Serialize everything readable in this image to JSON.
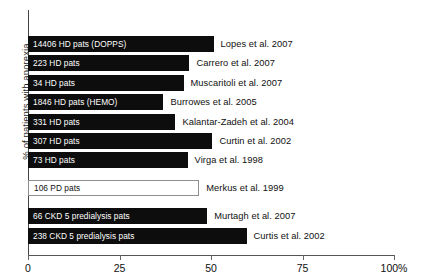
{
  "chart_data": {
    "type": "bar",
    "orientation": "horizontal",
    "title": "",
    "xlabel": "",
    "ylabel": "% of patients with anorexia",
    "xlim": [
      0,
      100
    ],
    "grid": false,
    "legend": "none",
    "xticks": [
      {
        "value": 0,
        "label": "0"
      },
      {
        "value": 25,
        "label": "25"
      },
      {
        "value": 50,
        "label": "50"
      },
      {
        "value": 75,
        "label": "75"
      },
      {
        "value": 100,
        "label": "100%"
      }
    ],
    "colors": {
      "filled_bar": "#0d0d0d",
      "open_bar_fill": "#ffffff",
      "open_bar_border": "#8e8e8e",
      "axis": "#555555",
      "text": "#101010",
      "inverse_text": "#ffffff"
    },
    "categories": [
      "Lopes et al. 2007",
      "Carrero et al. 2007",
      "Muscaritoli et al. 2007",
      "Burrowes et al. 2005",
      "Kalantar-Zadeh et al. 2004",
      "Curtin et al. 2002",
      "Virga et al. 1998",
      "Merkus et al. 1999",
      "Murtagh et al. 2007",
      "Curtis et al. 2002"
    ],
    "values": [
      50.7,
      44.1,
      42.5,
      37.0,
      40.3,
      50.4,
      43.6,
      46.8,
      49.0,
      59.7
    ],
    "bars": [
      {
        "label": "14406 HD pats (DOPPS)",
        "author": "Lopes et al. 2007",
        "value": 50.7,
        "style": "filled",
        "group": "HD"
      },
      {
        "label": "223 HD pats",
        "author": "Carrero et al. 2007",
        "value": 44.1,
        "style": "filled",
        "group": "HD"
      },
      {
        "label": "34 HD pats",
        "author": "Muscaritoli et al. 2007",
        "value": 42.5,
        "style": "filled",
        "group": "HD"
      },
      {
        "label": "1846 HD pats (HEMO)",
        "author": "Burrowes et al. 2005",
        "value": 37.0,
        "style": "filled",
        "group": "HD"
      },
      {
        "label": "331 HD pats",
        "author": "Kalantar-Zadeh et al. 2004",
        "value": 40.3,
        "style": "filled",
        "group": "HD"
      },
      {
        "label": "307 HD pats",
        "author": "Curtin et al. 2002",
        "value": 50.4,
        "style": "filled",
        "group": "HD"
      },
      {
        "label": "73 HD pats",
        "author": "Virga et al. 1998",
        "value": 43.6,
        "style": "filled",
        "group": "HD"
      },
      {
        "label": "106 PD pats",
        "author": "Merkus et al. 1999",
        "value": 46.8,
        "style": "open",
        "group": "PD"
      },
      {
        "label": "66 CKD 5 predialysis pats",
        "author": "Murtagh et al. 2007",
        "value": 49.0,
        "style": "filled",
        "group": "CKD5"
      },
      {
        "label": "238 CKD 5 predialysis pats",
        "author": "Curtis et al. 2002",
        "value": 59.7,
        "style": "filled",
        "group": "CKD5"
      }
    ]
  }
}
